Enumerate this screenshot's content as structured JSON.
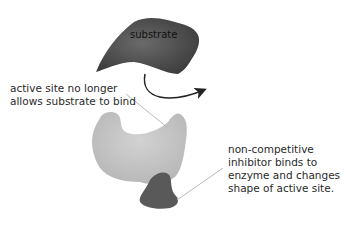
{
  "diagram": {
    "substrate_label": "substrate",
    "active_site_note": [
      "active site no longer",
      "allows substrate to bind"
    ],
    "inhibitor_note": [
      "non-competitive",
      "inhibitor binds to",
      "enzyme and changes",
      "shape of active site."
    ],
    "colors": {
      "substrate": "#555555",
      "enzyme": "#c8c8c8",
      "inhibitor": "#5a5a5a",
      "arrow": "#222222",
      "leader_line": "#bbbbbb"
    }
  }
}
